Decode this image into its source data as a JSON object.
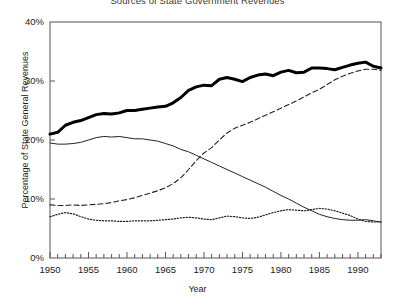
{
  "chart_data": {
    "type": "line",
    "title": "Sources of State Government Revenues",
    "xlabel": "Year",
    "ylabel": "Percentage of State General Revenues",
    "xlim": [
      1950,
      1993
    ],
    "ylim": [
      0,
      40
    ],
    "ytick_labels": [
      "0%",
      "10%",
      "20%",
      "30%",
      "40%"
    ],
    "ytick_values": [
      0,
      10,
      20,
      30,
      40
    ],
    "xtick_labels": [
      "1950",
      "1955",
      "1960",
      "1965",
      "1970",
      "1975",
      "1980",
      "1985",
      "1990"
    ],
    "xtick_values": [
      1950,
      1955,
      1960,
      1965,
      1970,
      1975,
      1980,
      1985,
      1990
    ],
    "minor_xticks": "annual",
    "grid": false,
    "legend": "none",
    "x": [
      1950,
      1951,
      1952,
      1953,
      1954,
      1955,
      1956,
      1957,
      1958,
      1959,
      1960,
      1961,
      1962,
      1963,
      1964,
      1965,
      1966,
      1967,
      1968,
      1969,
      1970,
      1971,
      1972,
      1973,
      1974,
      1975,
      1976,
      1977,
      1978,
      1979,
      1980,
      1981,
      1982,
      1983,
      1984,
      1985,
      1986,
      1987,
      1988,
      1989,
      1990,
      1991,
      1992,
      1993
    ],
    "series": [
      {
        "name": "thick-solid-series",
        "style": "thick solid",
        "color": "#000000",
        "values": [
          21.0,
          21.3,
          22.5,
          23.0,
          23.3,
          23.8,
          24.3,
          24.5,
          24.4,
          24.6,
          25.0,
          25.0,
          25.2,
          25.4,
          25.6,
          25.7,
          26.3,
          27.2,
          28.4,
          29.0,
          29.3,
          29.2,
          30.3,
          30.6,
          30.3,
          29.9,
          30.6,
          31.0,
          31.2,
          30.9,
          31.5,
          31.8,
          31.4,
          31.5,
          32.2,
          32.2,
          32.1,
          31.9,
          32.3,
          32.7,
          33.0,
          33.2,
          32.5,
          32.2
        ]
      },
      {
        "name": "thin-solid-series",
        "style": "thin solid",
        "color": "#222222",
        "values": [
          19.5,
          19.3,
          19.3,
          19.4,
          19.6,
          20.0,
          20.4,
          20.6,
          20.5,
          20.6,
          20.4,
          20.2,
          20.2,
          20.0,
          19.8,
          19.4,
          19.0,
          18.4,
          18.0,
          17.4,
          16.8,
          16.2,
          15.6,
          15.0,
          14.4,
          13.8,
          13.2,
          12.6,
          12.0,
          11.3,
          10.6,
          10.0,
          9.3,
          8.6,
          8.0,
          7.4,
          7.0,
          6.7,
          6.5,
          6.4,
          6.4,
          6.5,
          6.3,
          6.1
        ]
      },
      {
        "name": "dashed-series",
        "style": "dashed",
        "color": "#222222",
        "values": [
          9.0,
          8.9,
          8.9,
          9.0,
          8.9,
          9.0,
          9.1,
          9.2,
          9.4,
          9.7,
          9.9,
          10.2,
          10.6,
          11.0,
          11.4,
          11.9,
          12.6,
          13.6,
          15.0,
          16.5,
          17.8,
          18.7,
          20.0,
          21.2,
          22.0,
          22.5,
          23.0,
          23.6,
          24.2,
          24.8,
          25.4,
          26.0,
          26.6,
          27.3,
          28.0,
          28.6,
          29.4,
          30.2,
          30.8,
          31.3,
          31.7,
          32.0,
          32.0,
          31.8
        ]
      },
      {
        "name": "dotted-series",
        "style": "dotted",
        "color": "#222222",
        "values": [
          7.0,
          7.4,
          7.7,
          7.5,
          7.0,
          6.6,
          6.4,
          6.3,
          6.3,
          6.2,
          6.2,
          6.3,
          6.3,
          6.3,
          6.4,
          6.5,
          6.6,
          6.8,
          6.9,
          6.8,
          6.6,
          6.5,
          6.8,
          7.1,
          7.0,
          6.8,
          6.7,
          6.9,
          7.3,
          7.7,
          8.0,
          8.2,
          8.1,
          8.0,
          8.2,
          8.4,
          8.3,
          8.0,
          7.6,
          7.2,
          6.6,
          6.2,
          6.1,
          6.1
        ]
      }
    ]
  },
  "axes": {
    "plot_left_px": 50,
    "plot_right_px": 381,
    "plot_top_px": 22,
    "plot_bottom_px": 258,
    "frame_color": "#555555"
  }
}
